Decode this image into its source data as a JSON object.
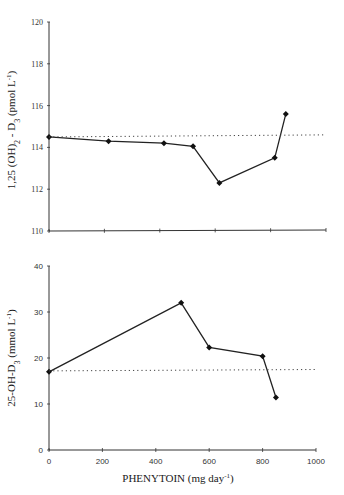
{
  "chart_data": [
    {
      "type": "line",
      "title": "",
      "xlabel": "",
      "ylabel": "1,25 (OH)2 - D3 (pmol L-1)",
      "ylabel_parts": {
        "main": "1,25 (OH)",
        "sub1": "2",
        "mid": " - D",
        "sub2": "3",
        "unit": " (pmol L",
        "sup": "-1",
        "end": ")"
      },
      "xlim": [
        0,
        1000
      ],
      "ylim": [
        110,
        120
      ],
      "x_ticks": [
        0,
        200,
        400,
        600,
        800,
        1000
      ],
      "x_tick_labels_shown": false,
      "y_ticks": [
        110,
        112,
        114,
        116,
        118,
        120
      ],
      "y_tick_labels": [
        "110",
        "112",
        "114",
        "116",
        "118",
        "120"
      ],
      "grid": false,
      "series": [
        {
          "name": "1,25 (OH)2-D3",
          "style": "solid-diamond-markers",
          "x": [
            0,
            215,
            415,
            520,
            615,
            815,
            855
          ],
          "values": [
            114.5,
            114.3,
            114.2,
            114.05,
            112.3,
            113.5,
            115.6
          ]
        },
        {
          "name": "baseline",
          "style": "dotted",
          "x": [
            0,
            1000
          ],
          "values": [
            114.5,
            114.6
          ]
        }
      ]
    },
    {
      "type": "line",
      "title": "",
      "xlabel": "PHENYTOIN (mg day-1)",
      "xlabel_parts": {
        "main": "PHENYTOIN (mg day",
        "sup": "-1",
        "end": ")"
      },
      "ylabel": "25-OH-D3 (mmol L-1)",
      "ylabel_parts": {
        "main": "25-OH-D",
        "sub": "3",
        "unit": " (mmol L",
        "sup": "-1",
        "end": ")"
      },
      "xlim": [
        0,
        1000
      ],
      "ylim": [
        0,
        40
      ],
      "x_ticks": [
        0,
        200,
        400,
        600,
        800,
        1000
      ],
      "x_tick_labels": [
        "0",
        "200",
        "400",
        "600",
        "800",
        "1000"
      ],
      "y_ticks": [
        0,
        10,
        20,
        30,
        40
      ],
      "y_tick_labels": [
        "0",
        "10",
        "20",
        "30",
        "40"
      ],
      "grid": false,
      "series": [
        {
          "name": "25-OH-D3",
          "style": "solid-diamond-markers",
          "x": [
            0,
            495,
            600,
            800,
            850
          ],
          "values": [
            17,
            32,
            22.3,
            20.4,
            11.4
          ]
        },
        {
          "name": "baseline",
          "style": "dotted",
          "x": [
            0,
            1000
          ],
          "values": [
            17.2,
            17.5
          ]
        }
      ]
    }
  ]
}
